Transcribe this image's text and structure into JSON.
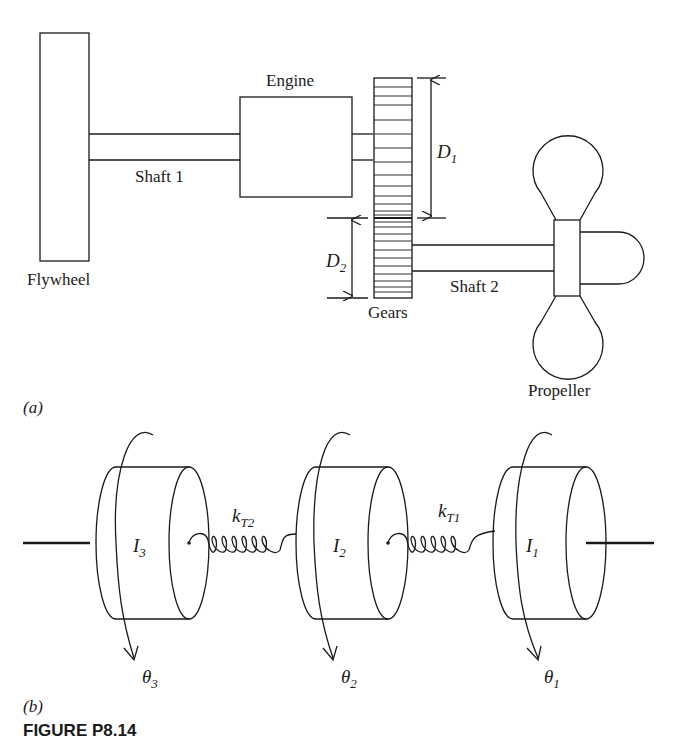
{
  "figure": {
    "caption": "FIGURE P8.14",
    "part_a": {
      "label": "(a)",
      "components": {
        "flywheel": "Flywheel",
        "shaft1": "Shaft 1",
        "engine": "Engine",
        "gears": "Gears",
        "shaft2": "Shaft 2",
        "propeller": "Propeller"
      },
      "dimensions": {
        "d1": {
          "symbol": "D",
          "subscript": "1"
        },
        "d2": {
          "symbol": "D",
          "subscript": "2"
        }
      }
    },
    "part_b": {
      "label": "(b)",
      "inertias": [
        {
          "symbol": "I",
          "subscript": "3"
        },
        {
          "symbol": "I",
          "subscript": "2"
        },
        {
          "symbol": "I",
          "subscript": "1"
        }
      ],
      "springs": [
        {
          "symbol": "k",
          "subscript": "T2"
        },
        {
          "symbol": "k",
          "subscript": "T1"
        }
      ],
      "angles": [
        {
          "symbol": "θ",
          "subscript": "3"
        },
        {
          "symbol": "θ",
          "subscript": "2"
        },
        {
          "symbol": "θ",
          "subscript": "1"
        }
      ]
    }
  }
}
